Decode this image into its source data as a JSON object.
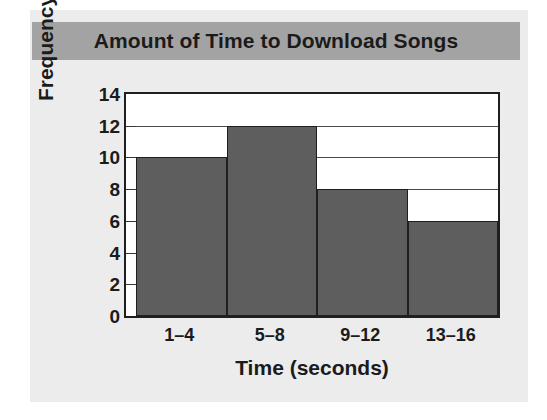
{
  "figure": {
    "title": "Amount of Time to Download Songs",
    "banner_color": "#a3a3a3",
    "card_color": "#ececed",
    "background_color": "#ffffff"
  },
  "chart_data": {
    "type": "bar",
    "title": "Amount of Time to Download Songs",
    "xlabel": "Time (seconds)",
    "ylabel": "Frequency",
    "categories": [
      "1–4",
      "5–8",
      "9–12",
      "13–16"
    ],
    "values": [
      10,
      12,
      8,
      6
    ],
    "ylim": [
      0,
      14
    ],
    "yticks": [
      0,
      2,
      4,
      6,
      8,
      10,
      12,
      14
    ],
    "ytick_labels": [
      "0",
      "2",
      "4",
      "6",
      "8",
      "10",
      "12",
      "14"
    ],
    "gridlines": true,
    "grid_axis": "y",
    "legend": null,
    "bar_color": "#5e5e5e",
    "bar_edge_color": "#1f1f1f",
    "bar_gap": 0,
    "series": [
      {
        "name": "Frequency",
        "values": [
          10,
          12,
          8,
          6
        ]
      }
    ]
  }
}
